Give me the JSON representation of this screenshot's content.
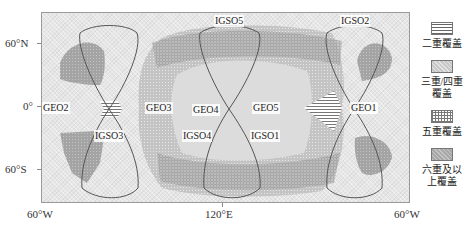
{
  "axes": {
    "y_ticks": [
      {
        "label": "60°N",
        "y": 43
      },
      {
        "label": "0°",
        "y": 106
      },
      {
        "label": "60°S",
        "y": 169
      }
    ],
    "x_ticks": [
      {
        "label": "60°W",
        "x": 41
      },
      {
        "label": "120°E",
        "x": 222
      },
      {
        "label": "60°W",
        "x": 410
      }
    ]
  },
  "satellites": {
    "geo": [
      {
        "name": "GEO1",
        "label": "GEO1"
      },
      {
        "name": "GEO2",
        "label": "GEO2"
      },
      {
        "name": "GEO3",
        "label": "GEO3"
      },
      {
        "name": "GEO4",
        "label": "GEO4"
      },
      {
        "name": "GEO5",
        "label": "GEO5"
      }
    ],
    "igso": [
      {
        "name": "IGSO1",
        "label": "IGSO1"
      },
      {
        "name": "IGSO2",
        "label": "IGSO2"
      },
      {
        "name": "IGSO3",
        "label": "IGSO3"
      },
      {
        "name": "IGSO4",
        "label": "IGSO4"
      },
      {
        "name": "IGSO5",
        "label": "IGSO5"
      }
    ]
  },
  "legend": {
    "items": [
      {
        "key": "double",
        "label_line1": "二重覆盖",
        "label_line2": ""
      },
      {
        "key": "triple_quad",
        "label_line1": "三重/四重",
        "label_line2": "覆盖"
      },
      {
        "key": "five",
        "label_line1": "五重覆盖",
        "label_line2": ""
      },
      {
        "key": "six_plus",
        "label_line1": "六重及以",
        "label_line2": "上覆盖"
      }
    ]
  },
  "colors": {
    "frame_bg": "#e6e6e6",
    "coverage_tri_quad": "#c8c8c8",
    "coverage_six_plus": "#a8a8a8",
    "track_line": "#555555"
  }
}
